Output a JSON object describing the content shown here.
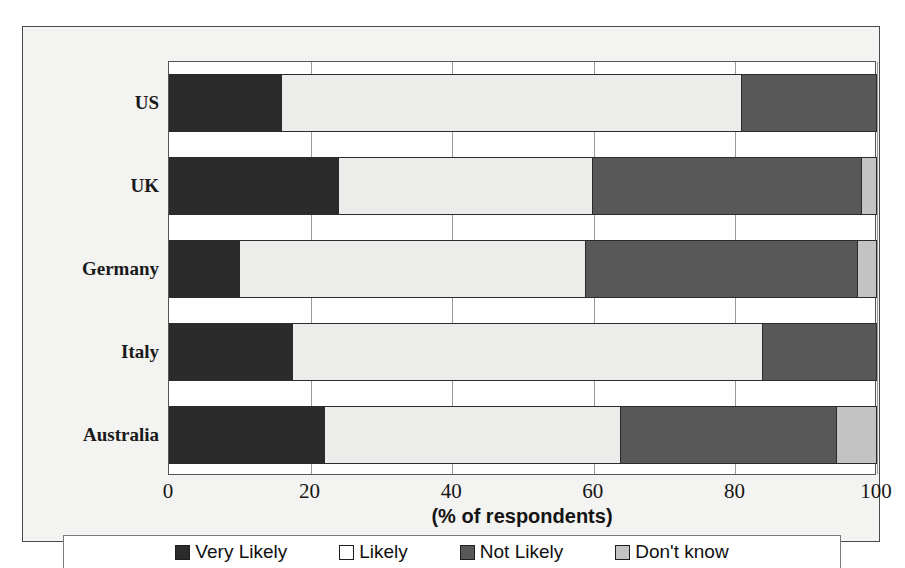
{
  "chart_data": {
    "type": "bar",
    "subtype": "horizontal-stacked-100",
    "title": "",
    "xlabel": "(% of respondents)",
    "ylabel": "",
    "categories": [
      "US",
      "UK",
      "Germany",
      "Italy",
      "Australia"
    ],
    "series": [
      {
        "name": "Very Likely",
        "color": "#2b2b2b",
        "values": [
          16,
          24,
          10,
          17.5,
          22
        ]
      },
      {
        "name": "Likely",
        "color": "#ececeb",
        "values": [
          65,
          36,
          49,
          66.5,
          42
        ]
      },
      {
        "name": "Not Likely",
        "color": "#585858",
        "values": [
          19,
          38,
          38.5,
          16,
          30.5
        ]
      },
      {
        "name": "Don't know",
        "color": "#c3c3c3",
        "values": [
          0,
          2,
          2.5,
          0,
          5.5
        ]
      }
    ],
    "xlim": [
      0,
      100
    ],
    "xticks": [
      0,
      20,
      40,
      60,
      80,
      100
    ],
    "xtick_labels": [
      "0",
      "20",
      "40",
      "60",
      "80",
      "100"
    ],
    "grid": true,
    "legend_position": "bottom",
    "legend_entries": [
      "Very Likely",
      "Likely",
      "Not Likely",
      "Don't know"
    ]
  },
  "axis": {
    "x_title": "(% of respondents)"
  }
}
